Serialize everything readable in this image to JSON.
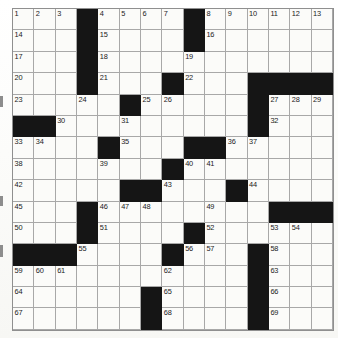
{
  "puzzle": {
    "kind": "crossword-grid",
    "size": {
      "rows": 15,
      "cols": 15
    },
    "colors": {
      "block": "#151515",
      "cell": "#fbfbf9",
      "grid_line": "#a8a8a8",
      "number": "#1a1a1a",
      "page": "#fdfdfb"
    },
    "blocks": [
      [
        0,
        3
      ],
      [
        0,
        8
      ],
      [
        1,
        3
      ],
      [
        1,
        8
      ],
      [
        2,
        3
      ],
      [
        3,
        3
      ],
      [
        3,
        7
      ],
      [
        3,
        11
      ],
      [
        3,
        12
      ],
      [
        3,
        13
      ],
      [
        3,
        14
      ],
      [
        4,
        5
      ],
      [
        4,
        11
      ],
      [
        5,
        0
      ],
      [
        5,
        1
      ],
      [
        5,
        11
      ],
      [
        6,
        4
      ],
      [
        6,
        8
      ],
      [
        6,
        9
      ],
      [
        7,
        7
      ],
      [
        8,
        5
      ],
      [
        8,
        6
      ],
      [
        8,
        10
      ],
      [
        9,
        3
      ],
      [
        9,
        12
      ],
      [
        9,
        13
      ],
      [
        9,
        14
      ],
      [
        10,
        3
      ],
      [
        10,
        8
      ],
      [
        11,
        0
      ],
      [
        11,
        1
      ],
      [
        11,
        2
      ],
      [
        11,
        7
      ],
      [
        11,
        11
      ],
      [
        12,
        11
      ],
      [
        13,
        6
      ],
      [
        13,
        11
      ],
      [
        14,
        6
      ],
      [
        14,
        11
      ]
    ],
    "numbers": [
      {
        "n": "1",
        "r": 0,
        "c": 0
      },
      {
        "n": "2",
        "r": 0,
        "c": 1
      },
      {
        "n": "3",
        "r": 0,
        "c": 2
      },
      {
        "n": "4",
        "r": 0,
        "c": 4
      },
      {
        "n": "5",
        "r": 0,
        "c": 5
      },
      {
        "n": "6",
        "r": 0,
        "c": 6
      },
      {
        "n": "7",
        "r": 0,
        "c": 7
      },
      {
        "n": "8",
        "r": 0,
        "c": 9
      },
      {
        "n": "9",
        "r": 0,
        "c": 10
      },
      {
        "n": "10",
        "r": 0,
        "c": 11
      },
      {
        "n": "11",
        "r": 0,
        "c": 12
      },
      {
        "n": "12",
        "r": 0,
        "c": 13
      },
      {
        "n": "13",
        "r": 0,
        "c": 14
      },
      {
        "n": "14",
        "r": 1,
        "c": 0
      },
      {
        "n": "15",
        "r": 1,
        "c": 4
      },
      {
        "n": "16",
        "r": 1,
        "c": 9
      },
      {
        "n": "17",
        "r": 2,
        "c": 0
      },
      {
        "n": "18",
        "r": 2,
        "c": 4
      },
      {
        "n": "19",
        "r": 2,
        "c": 8
      },
      {
        "n": "20",
        "r": 3,
        "c": 0
      },
      {
        "n": "21",
        "r": 3,
        "c": 4
      },
      {
        "n": "22",
        "r": 3,
        "c": 8
      },
      {
        "n": "23",
        "r": 4,
        "c": 0
      },
      {
        "n": "24",
        "r": 4,
        "c": 3
      },
      {
        "n": "25",
        "r": 4,
        "c": 6
      },
      {
        "n": "26",
        "r": 4,
        "c": 7
      },
      {
        "n": "27",
        "r": 4,
        "c": 12
      },
      {
        "n": "28",
        "r": 4,
        "c": 13
      },
      {
        "n": "29",
        "r": 4,
        "c": 14
      },
      {
        "n": "30",
        "r": 5,
        "c": 2
      },
      {
        "n": "31",
        "r": 5,
        "c": 5
      },
      {
        "n": "32",
        "r": 5,
        "c": 12
      },
      {
        "n": "33",
        "r": 6,
        "c": 0
      },
      {
        "n": "34",
        "r": 6,
        "c": 1
      },
      {
        "n": "35",
        "r": 6,
        "c": 5
      },
      {
        "n": "36",
        "r": 6,
        "c": 10
      },
      {
        "n": "37",
        "r": 6,
        "c": 11
      },
      {
        "n": "38",
        "r": 7,
        "c": 0
      },
      {
        "n": "39",
        "r": 7,
        "c": 4
      },
      {
        "n": "40",
        "r": 7,
        "c": 8
      },
      {
        "n": "41",
        "r": 7,
        "c": 9
      },
      {
        "n": "42",
        "r": 8,
        "c": 0
      },
      {
        "n": "43",
        "r": 8,
        "c": 7
      },
      {
        "n": "44",
        "r": 8,
        "c": 11
      },
      {
        "n": "45",
        "r": 9,
        "c": 0
      },
      {
        "n": "46",
        "r": 9,
        "c": 4
      },
      {
        "n": "47",
        "r": 9,
        "c": 5
      },
      {
        "n": "48",
        "r": 9,
        "c": 6
      },
      {
        "n": "49",
        "r": 9,
        "c": 9
      },
      {
        "n": "50",
        "r": 10,
        "c": 0
      },
      {
        "n": "51",
        "r": 10,
        "c": 4
      },
      {
        "n": "52",
        "r": 10,
        "c": 9
      },
      {
        "n": "53",
        "r": 10,
        "c": 12
      },
      {
        "n": "54",
        "r": 10,
        "c": 13
      },
      {
        "n": "55",
        "r": 11,
        "c": 3
      },
      {
        "n": "56",
        "r": 11,
        "c": 8
      },
      {
        "n": "57",
        "r": 11,
        "c": 9
      },
      {
        "n": "58",
        "r": 11,
        "c": 12
      },
      {
        "n": "59",
        "r": 12,
        "c": 0
      },
      {
        "n": "60",
        "r": 12,
        "c": 1
      },
      {
        "n": "61",
        "r": 12,
        "c": 2
      },
      {
        "n": "62",
        "r": 12,
        "c": 7
      },
      {
        "n": "63",
        "r": 12,
        "c": 12
      },
      {
        "n": "64",
        "r": 13,
        "c": 0
      },
      {
        "n": "65",
        "r": 13,
        "c": 7
      },
      {
        "n": "66",
        "r": 13,
        "c": 12
      },
      {
        "n": "67",
        "r": 14,
        "c": 0
      },
      {
        "n": "68",
        "r": 14,
        "c": 7
      },
      {
        "n": "69",
        "r": 14,
        "c": 12
      }
    ]
  }
}
